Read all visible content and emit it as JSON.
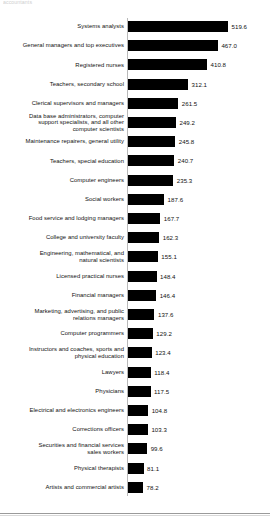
{
  "clipped_header_text": "accountants",
  "chart_data": {
    "type": "bar",
    "orientation": "horizontal",
    "title": "",
    "subtitle": "",
    "xlabel": "",
    "ylabel": "",
    "grid": false,
    "legend": "none",
    "xlim": [
      0,
      519.6
    ],
    "value_precision": 1,
    "bar_color": "#000000",
    "axis_color": "#b9b9b9",
    "categories": [
      "Systems analysts",
      "General managers and top executives",
      "Registered nurses",
      "Teachers, secondary school",
      "Clerical supervisors and managers",
      "Data base administrators, computer support specialists, and all other computer scientists",
      "Maintenance repairers, general utility",
      "Teachers, special education",
      "Computer engineers",
      "Social workers",
      "Food service and lodging managers",
      "College and university faculty",
      "Engineering, mathematical, and natural scientists",
      "Licensed practical nurses",
      "Financial managers",
      "Marketing, advertising, and public relations managers",
      "Computer programmers",
      "Instructors and coaches, sports and physical education",
      "Lawyers",
      "Physicians",
      "Electrical and electronics engineers",
      "Corrections officers",
      "Securities and financial services sales workers",
      "Physical therapists",
      "Artists and commercial artists"
    ],
    "values": [
      519.6,
      467.0,
      410.8,
      312.1,
      261.5,
      249.2,
      245.8,
      240.7,
      235.3,
      187.6,
      167.7,
      162.3,
      155.1,
      148.4,
      146.4,
      137.6,
      129.2,
      123.4,
      118.4,
      117.5,
      104.8,
      103.3,
      99.6,
      81.1,
      78.2
    ],
    "value_labels": [
      "519.6",
      "467.0",
      "410.8",
      "312.1",
      "261.5",
      "249.2",
      "245.8",
      "240.7",
      "235.3",
      "187.6",
      "167.7",
      "162.3",
      "155.1",
      "148.4",
      "146.4",
      "137.6",
      "129.2",
      "123.4",
      "118.4",
      "117.5",
      "104.8",
      "103.3",
      "99.6",
      "81.1",
      "78.2"
    ],
    "rows": [
      {
        "label_lines": [
          "Systems analysts"
        ],
        "value": 519.6,
        "value_label": "519.6"
      },
      {
        "label_lines": [
          "General managers and top executives"
        ],
        "value": 467.0,
        "value_label": "467.0"
      },
      {
        "label_lines": [
          "Registered nurses"
        ],
        "value": 410.8,
        "value_label": "410.8"
      },
      {
        "label_lines": [
          "Teachers, secondary school"
        ],
        "value": 312.1,
        "value_label": "312.1"
      },
      {
        "label_lines": [
          "Clerical supervisors and managers"
        ],
        "value": 261.5,
        "value_label": "261.5"
      },
      {
        "label_lines": [
          "Data base administrators, computer",
          "support specialists, and all other",
          "computer scientists"
        ],
        "value": 249.2,
        "value_label": "249.2"
      },
      {
        "label_lines": [
          "Maintenance repairers, general utility"
        ],
        "value": 245.8,
        "value_label": "245.8"
      },
      {
        "label_lines": [
          "Teachers, special education"
        ],
        "value": 240.7,
        "value_label": "240.7"
      },
      {
        "label_lines": [
          "Computer engineers"
        ],
        "value": 235.3,
        "value_label": "235.3"
      },
      {
        "label_lines": [
          "Social workers"
        ],
        "value": 187.6,
        "value_label": "187.6"
      },
      {
        "label_lines": [
          "Food service and lodging managers"
        ],
        "value": 167.7,
        "value_label": "167.7"
      },
      {
        "label_lines": [
          "College and university faculty"
        ],
        "value": 162.3,
        "value_label": "162.3"
      },
      {
        "label_lines": [
          "Engineering, mathematical, and",
          "natural scientists"
        ],
        "value": 155.1,
        "value_label": "155.1"
      },
      {
        "label_lines": [
          "Licensed practical nurses"
        ],
        "value": 148.4,
        "value_label": "148.4"
      },
      {
        "label_lines": [
          "Financial managers"
        ],
        "value": 146.4,
        "value_label": "146.4"
      },
      {
        "label_lines": [
          "Marketing, advertising, and public",
          "relations managers"
        ],
        "value": 137.6,
        "value_label": "137.6"
      },
      {
        "label_lines": [
          "Computer programmers"
        ],
        "value": 129.2,
        "value_label": "129.2"
      },
      {
        "label_lines": [
          "Instructors and coaches, sports and",
          "physical education"
        ],
        "value": 123.4,
        "value_label": "123.4"
      },
      {
        "label_lines": [
          "Lawyers"
        ],
        "value": 118.4,
        "value_label": "118.4"
      },
      {
        "label_lines": [
          "Physicians"
        ],
        "value": 117.5,
        "value_label": "117.5"
      },
      {
        "label_lines": [
          "Electrical and electronics engineers"
        ],
        "value": 104.8,
        "value_label": "104.8"
      },
      {
        "label_lines": [
          "Corrections officers"
        ],
        "value": 103.3,
        "value_label": "103.3"
      },
      {
        "label_lines": [
          "Securities and financial services",
          "sales workers"
        ],
        "value": 99.6,
        "value_label": "99.6"
      },
      {
        "label_lines": [
          "Physical therapists"
        ],
        "value": 81.1,
        "value_label": "81.1"
      },
      {
        "label_lines": [
          "Artists and commercial artists"
        ],
        "value": 78.2,
        "value_label": "78.2"
      }
    ]
  }
}
